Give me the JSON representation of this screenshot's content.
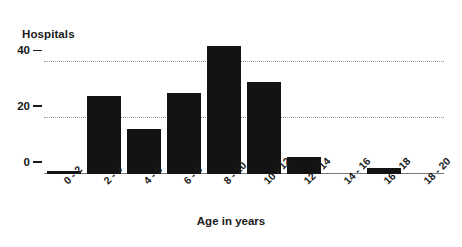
{
  "chart_data": {
    "type": "bar",
    "title": "",
    "xlabel": "Age in years",
    "ylabel": "Hospitals",
    "categories": [
      "0 - 2",
      "2 - 4",
      "4 - 6",
      "6 - 8",
      "8 - 10",
      "10 - 12",
      "12 - 14",
      "14 - 16",
      "16 - 18",
      "18 - 20"
    ],
    "values": [
      1,
      28,
      16,
      29,
      46,
      33,
      6,
      0,
      2,
      0
    ],
    "ylim": [
      0,
      48
    ],
    "yticks": [
      0,
      20,
      40
    ],
    "ytick_labels": [
      "0",
      "20",
      "40"
    ],
    "grid": "horizontal-dotted",
    "legend": "none",
    "bar_color": "#131313",
    "grid_color": "#9a9a9a",
    "axis_color": "#7a7a7a",
    "text_color": "#1a1a1a"
  }
}
